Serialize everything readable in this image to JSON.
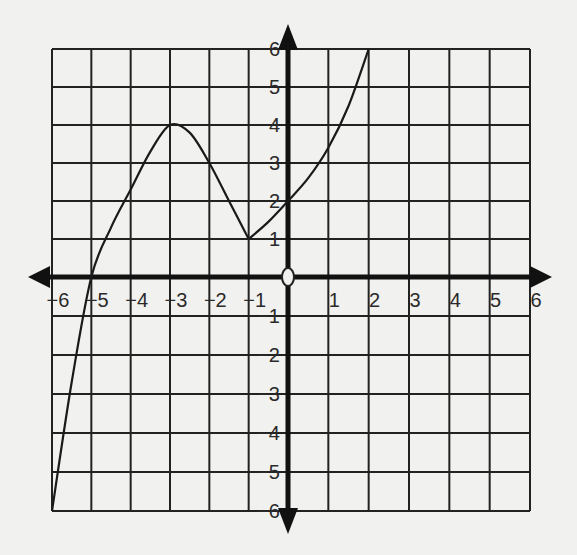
{
  "chart_data": {
    "type": "line",
    "title": "",
    "xlabel": "",
    "ylabel": "",
    "xlim": [
      -6,
      6
    ],
    "ylim": [
      -6,
      6
    ],
    "grid": true,
    "x_ticks": [
      -6,
      -5,
      -4,
      -3,
      -2,
      -1,
      0,
      1,
      2,
      3,
      4,
      5,
      6
    ],
    "y_ticks": [
      -6,
      -5,
      -4,
      -3,
      -2,
      -1,
      0,
      1,
      2,
      3,
      4,
      5,
      6
    ],
    "x_tick_labels": [
      "−6",
      "−5",
      "−4",
      "−3",
      "−2",
      "−1",
      "0",
      "1",
      "2",
      "3",
      "4",
      "5",
      "6"
    ],
    "y_tick_labels": [
      "−6",
      "−5",
      "−4",
      "−3",
      "−2",
      "−1",
      "0",
      "1",
      "2",
      "3",
      "4",
      "5",
      "6"
    ],
    "series": [
      {
        "name": "f(x)",
        "x": [
          -6,
          -5.5,
          -5,
          -4.5,
          -4,
          -3.5,
          -3,
          -2.5,
          -2,
          -1.5,
          -1,
          -0.5,
          0,
          0.5,
          1,
          1.5,
          2
        ],
        "y": [
          -6,
          -2.7,
          0,
          1.3,
          2.3,
          3.3,
          4,
          3.8,
          3,
          2.0,
          1,
          1.45,
          2,
          2.6,
          3.4,
          4.5,
          6
        ]
      }
    ],
    "key_points": [
      {
        "x": -6,
        "y": -6,
        "note": "left endpoint"
      },
      {
        "x": -5,
        "y": 0,
        "note": "x-intercept"
      },
      {
        "x": -3,
        "y": 4,
        "note": "local maximum"
      },
      {
        "x": -1,
        "y": 1,
        "note": "local minimum (cusp)"
      },
      {
        "x": 0,
        "y": 2,
        "note": "y-intercept"
      },
      {
        "x": 2,
        "y": 6,
        "note": "right endpoint"
      }
    ],
    "colors": {
      "background": "#f1f1ef",
      "ink": "#1a1a1a"
    }
  }
}
